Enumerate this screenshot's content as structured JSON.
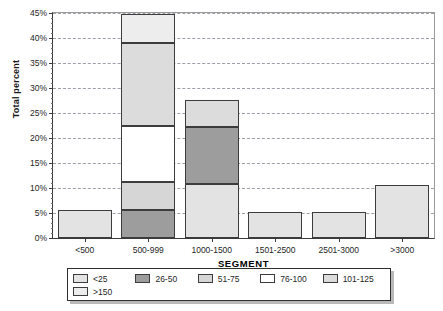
{
  "chart_data": {
    "type": "bar",
    "subtype": "stacked-bar",
    "title": "",
    "xlabel": "SEGMENT",
    "ylabel": "Total percent",
    "categories": [
      "<500",
      "500-999",
      "1000-1500",
      "1501-2500",
      "2501-3000",
      ">3000"
    ],
    "ylim": [
      0,
      45
    ],
    "ytick_labels": [
      "0%",
      "5%",
      "10%",
      "15%",
      "20%",
      "25%",
      "30%",
      "35%",
      "40%",
      "45%"
    ],
    "ytick_values": [
      0,
      5,
      10,
      15,
      20,
      25,
      30,
      35,
      40,
      45
    ],
    "y_unit": "%",
    "grid": true,
    "grid_axis": "y",
    "grid_style": "dashed",
    "legend_position": "bottom",
    "series": [
      {
        "name": "<25",
        "color": "#e3e3e3",
        "values": [
          5.6,
          0,
          10.9,
          5.3,
          5.2,
          10.6
        ]
      },
      {
        "name": "26-50",
        "color": "#9d9d9d",
        "values": [
          0,
          5.7,
          11.4,
          0,
          0,
          0
        ]
      },
      {
        "name": "51-75",
        "color": "#d6d6d6",
        "values": [
          0,
          5.6,
          0,
          0,
          0,
          0
        ]
      },
      {
        "name": "76-100",
        "color": "#ffffff",
        "values": [
          0,
          11.2,
          0,
          0,
          0,
          0
        ]
      },
      {
        "name": "101-125",
        "color": "#dcdcdc",
        "values": [
          0,
          16.5,
          5.3,
          0,
          0,
          0
        ]
      },
      {
        "name": ">150",
        "color": "#ededed",
        "values": [
          0,
          5.8,
          0,
          0,
          0,
          0
        ]
      }
    ],
    "stack_totals": [
      5.6,
      44.8,
      27.6,
      5.3,
      5.2,
      10.6
    ],
    "stacks": [
      {
        "category": "<500",
        "segments": [
          {
            "series": "<25",
            "from": 0,
            "to": 5.6
          }
        ]
      },
      {
        "category": "500-999",
        "segments": [
          {
            "series": "26-50",
            "from": 0,
            "to": 5.7
          },
          {
            "series": "51-75",
            "from": 5.7,
            "to": 11.3
          },
          {
            "series": "76-100",
            "from": 11.3,
            "to": 22.5
          },
          {
            "series": "101-125",
            "from": 22.5,
            "to": 39.0
          },
          {
            "series": ">150",
            "from": 39.0,
            "to": 44.8
          }
        ]
      },
      {
        "category": "1000-1500",
        "segments": [
          {
            "series": "<25",
            "from": 0,
            "to": 10.9
          },
          {
            "series": "26-50",
            "from": 10.9,
            "to": 22.3
          },
          {
            "series": "101-125",
            "from": 22.3,
            "to": 27.6
          }
        ]
      },
      {
        "category": "1501-2500",
        "segments": [
          {
            "series": "<25",
            "from": 0,
            "to": 5.3
          }
        ]
      },
      {
        "category": "2501-3000",
        "segments": [
          {
            "series": "<25",
            "from": 0,
            "to": 5.2
          }
        ]
      },
      {
        "category": ">3000",
        "segments": [
          {
            "series": "<25",
            "from": 0,
            "to": 10.6
          }
        ]
      }
    ]
  },
  "axes": {
    "y_title": "Total percent",
    "x_title": "SEGMENT",
    "y_ticks": [
      {
        "label": "45%",
        "value": 45
      },
      {
        "label": "40%",
        "value": 40
      },
      {
        "label": "35%",
        "value": 35
      },
      {
        "label": "30%",
        "value": 30
      },
      {
        "label": "25%",
        "value": 25
      },
      {
        "label": "20%",
        "value": 20
      },
      {
        "label": "15%",
        "value": 15
      },
      {
        "label": "10%",
        "value": 10
      },
      {
        "label": "5%",
        "value": 5
      },
      {
        "label": "0%",
        "value": 0
      }
    ],
    "x_ticks": [
      "<500",
      "500-999",
      "1000-1500",
      "1501-2500",
      "2501-3000",
      ">3000"
    ]
  },
  "legend": {
    "items": [
      {
        "label": "<25",
        "color": "#e3e3e3"
      },
      {
        "label": "26-50",
        "color": "#9d9d9d"
      },
      {
        "label": "51-75",
        "color": "#d6d6d6"
      },
      {
        "label": "76-100",
        "color": "#ffffff"
      },
      {
        "label": "101-125",
        "color": "#dcdcdc"
      },
      {
        "label": ">150",
        "color": "#ededed"
      }
    ]
  },
  "colors": {
    "axis": "#3a3a3a",
    "grid": "#8e8e9a",
    "bar_outline": "#3c3c3c",
    "background": "#ffffff"
  }
}
